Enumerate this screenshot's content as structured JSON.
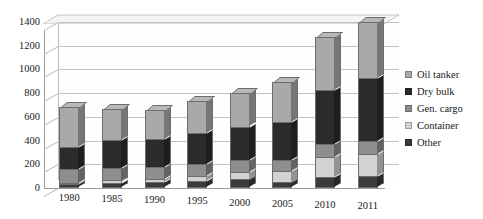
{
  "chart_data": {
    "type": "bar",
    "subtype": "stacked-bar-3d",
    "title": "",
    "xlabel": "",
    "ylabel": "",
    "ylim": [
      0,
      1400
    ],
    "ytick_step": 200,
    "yticks": [
      "1400",
      "1200",
      "1000",
      "800",
      "600",
      "400",
      "200",
      "0"
    ],
    "grid": true,
    "legend_position": "right",
    "categories": [
      "1980",
      "1985",
      "1990",
      "1995",
      "2000",
      "2005",
      "2010",
      "2011"
    ],
    "stack_order_bottom_to_top": [
      "Other",
      "Container",
      "Gen. cargo",
      "Dry bulk",
      "Oil tanker"
    ],
    "series": [
      {
        "name": "Other",
        "color": "#3b3b3b",
        "values": [
          31,
          45,
          49,
          58,
          75,
          49,
          92,
          100
        ]
      },
      {
        "name": "Container",
        "color": "#d2d2d2",
        "values": [
          11,
          20,
          26,
          44,
          64,
          98,
          169,
          184
        ]
      },
      {
        "name": "Gen. cargo",
        "color": "#8e8e8e",
        "values": [
          116,
          106,
          103,
          104,
          101,
          92,
          108,
          109
        ]
      },
      {
        "name": "Dry bulk",
        "color": "#2b2b2b",
        "values": [
          186,
          232,
          235,
          262,
          276,
          321,
          457,
          532
        ]
      },
      {
        "name": "Oil tanker",
        "color": "#a9a9a9",
        "values": [
          339,
          261,
          246,
          268,
          282,
          336,
          450,
          475
        ]
      }
    ],
    "totals": [
      683,
      664,
      659,
      736,
      798,
      896,
      1276,
      1400
    ]
  },
  "legend": {
    "items": [
      {
        "label": "Oil tanker",
        "color": "#a9a9a9"
      },
      {
        "label": "Dry bulk",
        "color": "#2b2b2b"
      },
      {
        "label": "Gen. cargo",
        "color": "#8e8e8e"
      },
      {
        "label": "Container",
        "color": "#d2d2d2"
      },
      {
        "label": "Other",
        "color": "#3b3b3b"
      }
    ]
  }
}
